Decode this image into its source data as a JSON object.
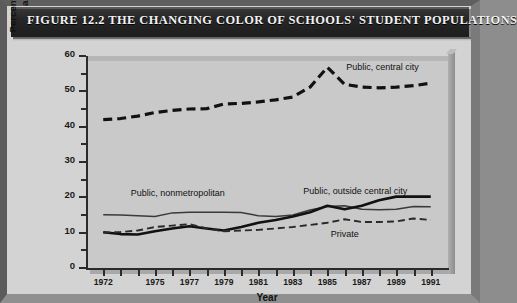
{
  "figure": {
    "title": "FIGURE 12.2  THE CHANGING COLOR OF SCHOOLS' STUDENT POPULATIONS",
    "frame_color": "#6f6f6f",
    "board_color": "#d3d3d3",
    "titlebar_color": "#262626",
    "plot_bg_color": "#c9c9c9",
    "ink_color": "#1a1a1a"
  },
  "chart_data": {
    "type": "line",
    "title": "FIGURE 12.2  THE CHANGING COLOR OF SCHOOLS' STUDENT POPULATIONS",
    "xlabel": "Year",
    "ylabel": "Percentage of African American and Latino Students",
    "ylabel_line1": "Percentage of African American",
    "ylabel_line2": "and Latino Students",
    "xlim": [
      1971,
      1992
    ],
    "ylim": [
      0,
      60
    ],
    "yticks": [
      0,
      10,
      20,
      30,
      40,
      50,
      60
    ],
    "yticks_minor": [
      5,
      15,
      25,
      35,
      45,
      55
    ],
    "ytick_labels": [
      "0",
      "10",
      "20",
      "30",
      "40",
      "50",
      "60"
    ],
    "xticks": [
      1972,
      1973,
      1974,
      1975,
      1976,
      1977,
      1978,
      1979,
      1980,
      1981,
      1982,
      1983,
      1984,
      1985,
      1986,
      1987,
      1988,
      1989,
      1990,
      1991
    ],
    "xtick_labels_shown": [
      "1972",
      "1975",
      "1977",
      "1979",
      "1981",
      "1983",
      "1985",
      "1987",
      "1989",
      "1991"
    ],
    "grid": false,
    "legend_position": "inline-annotations",
    "x": [
      1972,
      1973,
      1974,
      1975,
      1976,
      1977,
      1978,
      1979,
      1980,
      1981,
      1982,
      1983,
      1984,
      1985,
      1986,
      1987,
      1988,
      1989,
      1990,
      1991
    ],
    "series": [
      {
        "name": "Public, central city",
        "style": "thick-dashed",
        "color": "#111111",
        "label_x": 1986.1,
        "label_y": 56.6,
        "values": [
          42.0,
          42.3,
          43.0,
          44.0,
          44.6,
          45.0,
          45.1,
          46.4,
          46.6,
          47.0,
          47.6,
          48.4,
          51.2,
          56.8,
          52.0,
          51.2,
          51.0,
          51.2,
          51.6,
          52.3
        ]
      },
      {
        "name": "Public, nonmetropolitan",
        "style": "thin-solid",
        "color": "#3a3a3a",
        "label_x": 1973.6,
        "label_y": 21.0,
        "values": [
          15.1,
          15.0,
          14.8,
          14.6,
          15.6,
          15.8,
          15.8,
          15.8,
          15.7,
          14.8,
          14.6,
          15.0,
          16.4,
          17.4,
          17.6,
          16.6,
          16.5,
          16.6,
          17.4,
          17.3
        ]
      },
      {
        "name": "Public, outside central city",
        "style": "thick-solid",
        "color": "#111111",
        "label_x": 1983.6,
        "label_y": 21.6,
        "values": [
          10.1,
          9.6,
          9.5,
          10.4,
          11.2,
          11.8,
          11.2,
          10.6,
          11.6,
          12.8,
          13.6,
          14.6,
          15.8,
          17.6,
          16.6,
          17.6,
          19.2,
          20.2,
          20.2,
          20.2
        ]
      },
      {
        "name": "Private",
        "style": "thin-dashed",
        "color": "#2a2a2a",
        "label_x": 1985.2,
        "label_y": 9.2,
        "values": [
          10.0,
          10.2,
          10.6,
          11.6,
          12.0,
          12.4,
          11.2,
          10.4,
          10.6,
          10.8,
          11.2,
          11.6,
          12.2,
          12.8,
          13.8,
          13.0,
          13.0,
          13.2,
          14.0,
          13.6
        ]
      }
    ]
  }
}
